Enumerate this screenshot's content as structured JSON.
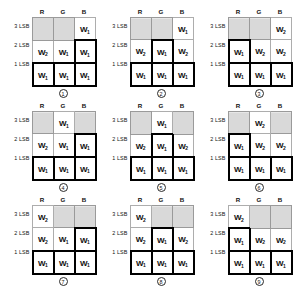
{
  "figure": {
    "column_headers": [
      "R",
      "G",
      "B"
    ],
    "row_labels": [
      "3 LSB",
      "2 LSB",
      "1 LSB"
    ],
    "symbols": {
      "w1": "W",
      "w2": "W",
      "w3": "W",
      "sub1": "1",
      "sub2": "2",
      "sub3": "3"
    },
    "colors": {
      "shaded_fill": "#b8b8b8",
      "cell_border": "#adadad",
      "bold_border": "#000000",
      "text": "#111111",
      "background": "#ffffff"
    },
    "panels": [
      {
        "id": "panel-1",
        "caption": "1",
        "cells": [
          [
            {
              "state": "shaded",
              "label": "",
              "sub": ""
            },
            {
              "state": "shaded",
              "label": "",
              "sub": ""
            },
            {
              "state": "thin",
              "label": "W",
              "sub": "1"
            }
          ],
          [
            {
              "state": "thin",
              "label": "W",
              "sub": "2"
            },
            {
              "state": "thin",
              "label": "W",
              "sub": "1"
            },
            {
              "state": "bold",
              "label": "W",
              "sub": "1"
            }
          ],
          [
            {
              "state": "bold",
              "label": "W",
              "sub": "1"
            },
            {
              "state": "bold",
              "label": "W",
              "sub": "1"
            },
            {
              "state": "bold",
              "label": "W",
              "sub": "1"
            }
          ]
        ]
      },
      {
        "id": "panel-2",
        "caption": "2",
        "cells": [
          [
            {
              "state": "shaded",
              "label": "",
              "sub": ""
            },
            {
              "state": "shaded",
              "label": "",
              "sub": ""
            },
            {
              "state": "thin",
              "label": "W",
              "sub": "1"
            }
          ],
          [
            {
              "state": "thin",
              "label": "W",
              "sub": "2"
            },
            {
              "state": "bold",
              "label": "W",
              "sub": "1"
            },
            {
              "state": "thin",
              "label": "W",
              "sub": "2"
            }
          ],
          [
            {
              "state": "bold",
              "label": "W",
              "sub": "1"
            },
            {
              "state": "bold",
              "label": "W",
              "sub": "1"
            },
            {
              "state": "bold",
              "label": "W",
              "sub": "1"
            }
          ]
        ]
      },
      {
        "id": "panel-3",
        "caption": "3",
        "cells": [
          [
            {
              "state": "shaded",
              "label": "",
              "sub": ""
            },
            {
              "state": "shaded",
              "label": "",
              "sub": ""
            },
            {
              "state": "thin",
              "label": "W",
              "sub": "2"
            }
          ],
          [
            {
              "state": "bold",
              "label": "W",
              "sub": "1"
            },
            {
              "state": "thin",
              "label": "W",
              "sub": "2"
            },
            {
              "state": "thin",
              "label": "W",
              "sub": "2"
            }
          ],
          [
            {
              "state": "bold",
              "label": "W",
              "sub": "1"
            },
            {
              "state": "bold",
              "label": "W",
              "sub": "1"
            },
            {
              "state": "bold",
              "label": "W",
              "sub": "1"
            }
          ]
        ]
      },
      {
        "id": "panel-4",
        "caption": "4",
        "cells": [
          [
            {
              "state": "shaded",
              "label": "",
              "sub": ""
            },
            {
              "state": "thin",
              "label": "W",
              "sub": "1"
            },
            {
              "state": "shaded",
              "label": "",
              "sub": ""
            }
          ],
          [
            {
              "state": "thin",
              "label": "W",
              "sub": "2"
            },
            {
              "state": "thin",
              "label": "W",
              "sub": "1"
            },
            {
              "state": "bold",
              "label": "W",
              "sub": "1"
            }
          ],
          [
            {
              "state": "bold",
              "label": "W",
              "sub": "1"
            },
            {
              "state": "bold",
              "label": "W",
              "sub": "1"
            },
            {
              "state": "bold",
              "label": "W",
              "sub": "1"
            }
          ]
        ]
      },
      {
        "id": "panel-5",
        "caption": "5",
        "cells": [
          [
            {
              "state": "shaded",
              "label": "",
              "sub": ""
            },
            {
              "state": "thin",
              "label": "W",
              "sub": "1"
            },
            {
              "state": "shaded",
              "label": "",
              "sub": ""
            }
          ],
          [
            {
              "state": "thin",
              "label": "W",
              "sub": "2"
            },
            {
              "state": "bold",
              "label": "W",
              "sub": "1"
            },
            {
              "state": "thin",
              "label": "W",
              "sub": "2"
            }
          ],
          [
            {
              "state": "bold",
              "label": "W",
              "sub": "1"
            },
            {
              "state": "bold",
              "label": "W",
              "sub": "1"
            },
            {
              "state": "bold",
              "label": "W",
              "sub": "1"
            }
          ]
        ]
      },
      {
        "id": "panel-6",
        "caption": "6",
        "cells": [
          [
            {
              "state": "shaded",
              "label": "",
              "sub": ""
            },
            {
              "state": "thin",
              "label": "W",
              "sub": "2"
            },
            {
              "state": "shaded",
              "label": "",
              "sub": ""
            }
          ],
          [
            {
              "state": "bold",
              "label": "W",
              "sub": "1"
            },
            {
              "state": "thin",
              "label": "W",
              "sub": "2"
            },
            {
              "state": "thin",
              "label": "W",
              "sub": "2"
            }
          ],
          [
            {
              "state": "bold",
              "label": "W",
              "sub": "1"
            },
            {
              "state": "bold",
              "label": "W",
              "sub": "1"
            },
            {
              "state": "bold",
              "label": "W",
              "sub": "1"
            }
          ]
        ]
      },
      {
        "id": "panel-7",
        "caption": "7",
        "cells": [
          [
            {
              "state": "thin",
              "label": "W",
              "sub": "2"
            },
            {
              "state": "shaded",
              "label": "",
              "sub": ""
            },
            {
              "state": "shaded",
              "label": "",
              "sub": ""
            }
          ],
          [
            {
              "state": "thin",
              "label": "W",
              "sub": "2"
            },
            {
              "state": "thin",
              "label": "W",
              "sub": "1"
            },
            {
              "state": "bold",
              "label": "W",
              "sub": "1"
            }
          ],
          [
            {
              "state": "bold",
              "label": "W",
              "sub": "1"
            },
            {
              "state": "bold",
              "label": "W",
              "sub": "1"
            },
            {
              "state": "bold",
              "label": "W",
              "sub": "1"
            }
          ]
        ]
      },
      {
        "id": "panel-8",
        "caption": "8",
        "cells": [
          [
            {
              "state": "thin",
              "label": "W",
              "sub": "2"
            },
            {
              "state": "shaded",
              "label": "",
              "sub": ""
            },
            {
              "state": "shaded",
              "label": "",
              "sub": ""
            }
          ],
          [
            {
              "state": "thin",
              "label": "W",
              "sub": "2"
            },
            {
              "state": "bold",
              "label": "W",
              "sub": "1"
            },
            {
              "state": "thin",
              "label": "W",
              "sub": "2"
            }
          ],
          [
            {
              "state": "bold",
              "label": "W",
              "sub": "1"
            },
            {
              "state": "bold",
              "label": "W",
              "sub": "1"
            },
            {
              "state": "bold",
              "label": "W",
              "sub": "1"
            }
          ]
        ]
      },
      {
        "id": "panel-9",
        "caption": "9",
        "cells": [
          [
            {
              "state": "thin",
              "label": "W",
              "sub": "2"
            },
            {
              "state": "shaded",
              "label": "",
              "sub": ""
            },
            {
              "state": "shaded",
              "label": "",
              "sub": ""
            }
          ],
          [
            {
              "state": "bold",
              "label": "W",
              "sub": "1"
            },
            {
              "state": "thin",
              "label": "W",
              "sub": "2"
            },
            {
              "state": "thin",
              "label": "W",
              "sub": "2"
            }
          ],
          [
            {
              "state": "bold",
              "label": "W",
              "sub": "1"
            },
            {
              "state": "bold",
              "label": "W",
              "sub": "1"
            },
            {
              "state": "bold",
              "label": "W",
              "sub": "1"
            }
          ]
        ]
      }
    ]
  }
}
